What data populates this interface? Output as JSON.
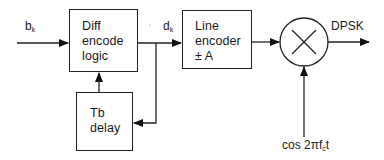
{
  "diagram": {
    "blocks": {
      "diff_encoder": {
        "lines": [
          "Diff",
          "encode",
          "logic"
        ]
      },
      "line_encoder": {
        "lines": [
          "Line",
          "encoder",
          "± A"
        ]
      },
      "delay": {
        "lines": [
          "Tb",
          "delay"
        ]
      },
      "multiplier": {
        "symbol": "×"
      }
    },
    "signals": {
      "input": {
        "base": "b",
        "sub": "k"
      },
      "encoded": {
        "base": "d",
        "sub": "k"
      },
      "output": "DPSK",
      "carrier": {
        "prefix": "cos 2πf",
        "sub": "c",
        "suffix": "t"
      }
    },
    "colors": {
      "stroke": "#222222",
      "background": "#ffffff"
    }
  }
}
